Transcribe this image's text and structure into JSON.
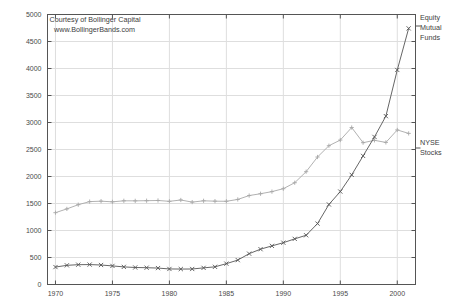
{
  "credit": {
    "line1": "Courtesy of Bollinger Capital",
    "line2": "www.BollingerBands.com"
  },
  "labels": {
    "equity_line1": "Equity",
    "equity_line2": "Mutual",
    "equity_line3": "Funds",
    "nyse_line1": "NYSE",
    "nyse_line2": "Stocks"
  },
  "colors": {
    "equity": "#555555",
    "nyse": "#a8a8a8",
    "frame": "#555555",
    "grid": "#dedede",
    "text": "#3d3d3d"
  },
  "chart_data": {
    "type": "line",
    "title": "",
    "subtitle": "",
    "xlabel": "",
    "ylabel": "",
    "xlim": [
      1969.3,
      2001.6
    ],
    "ylim": [
      0,
      5000
    ],
    "grid": true,
    "legend_position": "right-outside",
    "xticks": [
      1970,
      1975,
      1980,
      1985,
      1990,
      1995,
      2000
    ],
    "yticks": [
      0,
      500,
      1000,
      1500,
      2000,
      2500,
      3000,
      3500,
      4000,
      4500,
      5000
    ],
    "x": [
      1970,
      1971,
      1972,
      1973,
      1974,
      1975,
      1976,
      1977,
      1978,
      1979,
      1980,
      1981,
      1982,
      1983,
      1984,
      1985,
      1986,
      1987,
      1988,
      1989,
      1990,
      1991,
      1992,
      1993,
      1994,
      1995,
      1996,
      1997,
      1998,
      1999,
      2000,
      2001
    ],
    "series": [
      {
        "name": "NYSE Stocks",
        "marker": "plus",
        "color": "#a8a8a8",
        "values": [
          1330,
          1400,
          1478,
          1535,
          1543,
          1531,
          1550,
          1549,
          1552,
          1556,
          1540,
          1565,
          1526,
          1550,
          1543,
          1541,
          1575,
          1647,
          1681,
          1720,
          1774,
          1885,
          2089,
          2361,
          2570,
          2675,
          2907,
          2626,
          2670,
          2631,
          2862,
          2798
        ]
      },
      {
        "name": "Equity Mutual Funds",
        "marker": "cross",
        "color": "#555555",
        "values": [
          323,
          355,
          367,
          369,
          361,
          344,
          326,
          315,
          311,
          304,
          288,
          286,
          287,
          308,
          327,
          386,
          452,
          571,
          654,
          715,
          774,
          845,
          912,
          1128,
          1482,
          1721,
          2030,
          2381,
          2733,
          3118,
          3973,
          4743
        ]
      }
    ],
    "annotations": [
      "Courtesy of Bollinger Capital",
      "www.BollingerBands.com"
    ]
  }
}
